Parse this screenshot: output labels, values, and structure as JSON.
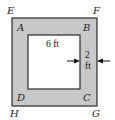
{
  "diagram": {
    "type": "concentric-squares",
    "colors": {
      "border_fill": "#c8c8c8",
      "inner_fill": "#ffffff",
      "stroke": "#2a2a2a"
    },
    "outer_vertices": {
      "top_left": "E",
      "top_right": "F",
      "bottom_right": "G",
      "bottom_left": "H"
    },
    "inner_vertices": {
      "top_left": "A",
      "top_right": "B",
      "bottom_right": "C",
      "bottom_left": "D"
    },
    "measurements": {
      "inner_side": "6 ft",
      "border_width_value": "2",
      "border_width_unit": "ft"
    }
  }
}
